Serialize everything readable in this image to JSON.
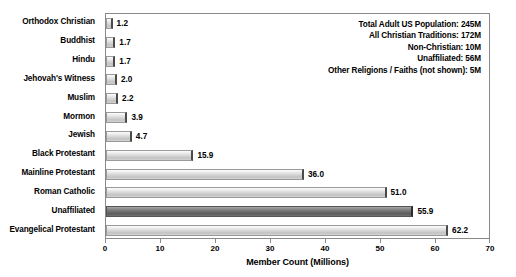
{
  "chart_data": {
    "type": "bar",
    "orientation": "horizontal",
    "title": "",
    "xlabel": "Member Count (Millions)",
    "ylabel": "",
    "xlim": [
      0,
      70
    ],
    "xticks": [
      0,
      10,
      20,
      30,
      40,
      50,
      60,
      70
    ],
    "grid": false,
    "legend": "none",
    "categories": [
      "Orthodox Christian",
      "Buddhist",
      "Hindu",
      "Jehovah's Witness",
      "Muslim",
      "Mormon",
      "Jewish",
      "Black Protestant",
      "Mainline Protestant",
      "Roman Catholic",
      "Unaffiliated",
      "Evangelical Protestant"
    ],
    "values": [
      1.2,
      1.7,
      1.7,
      2.0,
      2.2,
      3.9,
      4.7,
      15.9,
      36.0,
      51.0,
      55.9,
      62.2
    ],
    "value_labels": [
      "1.2",
      "1.7",
      "1.7",
      "2.0",
      "2.2",
      "3.9",
      "4.7",
      "15.9",
      "36.0",
      "51.0",
      "55.9",
      "62.2"
    ],
    "highlighted_category": "Unaffiliated",
    "colors": {
      "bar_light": "#d8d8d8",
      "bar_dark": "#6f6f6f",
      "border": "#8a8a8a",
      "text": "#000000",
      "background": "#ffffff"
    },
    "annotations": [
      "Total Adult US Population: 245M",
      "All Christian Traditions: 172M",
      "Non-Christian: 10M",
      "Unaffiliated: 56M",
      "Other Religions / Faiths (not shown): 5M"
    ]
  }
}
